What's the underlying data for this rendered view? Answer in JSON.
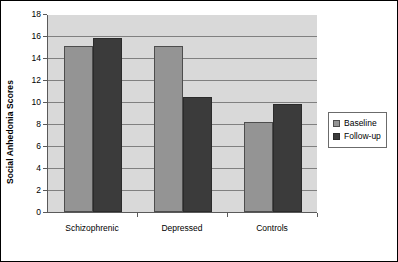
{
  "chart_data": {
    "type": "bar",
    "title": "",
    "xlabel": "",
    "ylabel": "Social Anhedonia Scores",
    "categories": [
      "Schizophrenic",
      "Depressed",
      "Controls"
    ],
    "series": [
      {
        "name": "Baseline",
        "values": [
          15.1,
          15.1,
          8.2
        ]
      },
      {
        "name": "Follow-up",
        "values": [
          15.8,
          10.5,
          9.8
        ]
      }
    ],
    "ylim": [
      0,
      18
    ],
    "ytick_labels": [
      "0",
      "2",
      "4",
      "6",
      "8",
      "10",
      "12",
      "14",
      "16",
      "18"
    ],
    "ytick_values": [
      0,
      2,
      4,
      6,
      8,
      10,
      12,
      14,
      16,
      18
    ],
    "grid": true,
    "grid_axis": "y",
    "legend_position": "right",
    "plot_background": "#d9d9d9",
    "figure_background": "#ffffff",
    "series_colors": [
      "#949494",
      "#3b3b3b"
    ]
  },
  "legend": {
    "items": [
      {
        "label": "Baseline",
        "swatch": "baseline-swatch"
      },
      {
        "label": "Follow-up",
        "swatch": "followup-swatch"
      }
    ]
  }
}
